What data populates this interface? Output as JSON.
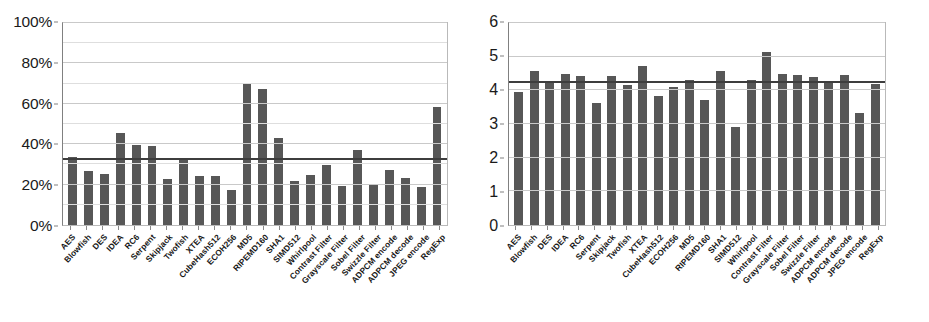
{
  "chart_data": [
    {
      "type": "bar",
      "panel": "left",
      "title": "",
      "xlabel": "",
      "ylabel": "",
      "ylim": [
        0,
        100
      ],
      "ytick_labels": [
        "0%",
        "20%",
        "40%",
        "60%",
        "80%",
        "100%"
      ],
      "ytick_values": [
        0,
        20,
        40,
        60,
        80,
        100
      ],
      "grid": true,
      "minor_gridlines": true,
      "legend": "none",
      "bar_color": "#575757",
      "average_line_color": "#3d3d3d",
      "average_value": 32.5,
      "categories": [
        "AES",
        "Blowfish",
        "DES",
        "IDEA",
        "RC6",
        "Serpent",
        "Skipjack",
        "Twofish",
        "XTEA",
        "CubeHash512",
        "ECOH256",
        "MD5",
        "RIPEMD160",
        "SHA1",
        "SIMD512",
        "Whirlpool",
        "Contrast Filter",
        "Grayscale Filter",
        "Sobel Filter",
        "Swizzle Filter",
        "ADPCM encode",
        "ADPCM decode",
        "JPEG encode",
        "RegExp"
      ],
      "values": [
        33.5,
        26.5,
        25.5,
        45.5,
        39.5,
        39.0,
        23.0,
        32.5,
        24.5,
        24.5,
        17.5,
        70.5,
        67.5,
        43.0,
        22.0,
        25.0,
        29.5,
        19.5,
        37.0,
        20.5,
        27.0,
        23.5,
        19.0,
        58.5
      ]
    },
    {
      "type": "bar",
      "panel": "right",
      "title": "",
      "xlabel": "",
      "ylabel": "",
      "ylim": [
        0,
        6
      ],
      "ytick_labels": [
        "0",
        "1",
        "2",
        "3",
        "4",
        "5",
        "6"
      ],
      "ytick_values": [
        0,
        1,
        2,
        3,
        4,
        5,
        6
      ],
      "grid": true,
      "minor_gridlines": false,
      "legend": "none",
      "bar_color": "#575757",
      "average_line_color": "#3d3d3d",
      "average_value": 4.24,
      "categories": [
        "AES",
        "Blowfish",
        "DES",
        "IDEA",
        "RC6",
        "Serpent",
        "Skipjack",
        "Twofish",
        "XTEA",
        "CubeHash512",
        "ECOH256",
        "MD5",
        "RIPEMD160",
        "SHA1",
        "SIMD512",
        "Whirlpool",
        "Contrast Filter",
        "Grayscale Filter",
        "Sobel Filter",
        "Swizzle Filter",
        "ADPCM encode",
        "ADPCM decode",
        "JPEG encode",
        "RegExp"
      ],
      "values": [
        3.95,
        4.58,
        4.25,
        4.5,
        4.43,
        3.62,
        4.43,
        4.16,
        4.72,
        3.84,
        4.11,
        4.31,
        3.71,
        4.58,
        2.9,
        4.32,
        5.15,
        4.5,
        4.47,
        4.41,
        4.23,
        4.47,
        3.32,
        4.2
      ]
    }
  ]
}
